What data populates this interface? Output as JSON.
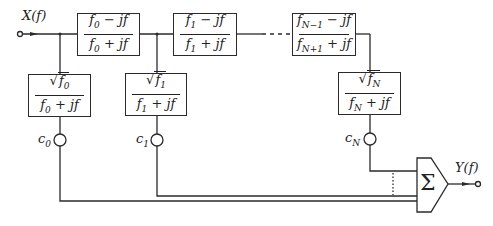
{
  "diagram": {
    "input_label": "X(f)",
    "output_label": "Y(f)",
    "summer_symbol": "Σ",
    "allpass_blocks": [
      {
        "num_var": "f",
        "num_sub": "0",
        "num_op": " − jf",
        "den_var": "f",
        "den_sub": "0",
        "den_op": " + jf"
      },
      {
        "num_var": "f",
        "num_sub": "1",
        "num_op": " − jf",
        "den_var": "f",
        "den_sub": "1",
        "den_op": " + jf"
      },
      {
        "num_var": "f",
        "num_sub": "N−1",
        "num_op": " − jf",
        "den_var": "f",
        "den_sub": "N+1",
        "den_op": " + jf"
      }
    ],
    "lowpass_blocks": [
      {
        "sqrt_var": "f",
        "sqrt_sub": "0",
        "den_var": "f",
        "den_sub": "0",
        "den_op": " + jf"
      },
      {
        "sqrt_var": "f",
        "sqrt_sub": "1",
        "den_var": "f",
        "den_sub": "1",
        "den_op": " + jf"
      },
      {
        "sqrt_var": "f",
        "sqrt_sub": "N",
        "den_var": "f",
        "den_sub": "N",
        "den_op": " + jf"
      }
    ],
    "coefficients": [
      {
        "var": "c",
        "sub": "0"
      },
      {
        "var": "c",
        "sub": "1"
      },
      {
        "var": "c",
        "sub": "N"
      }
    ],
    "colors": {
      "line": "#2a2a2a",
      "background": "#ffffff"
    }
  }
}
